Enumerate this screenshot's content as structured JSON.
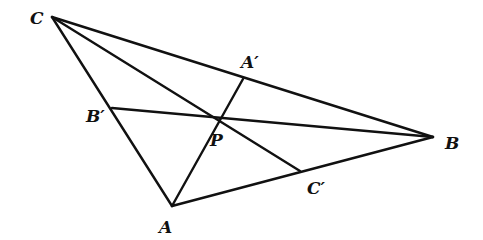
{
  "diagram": {
    "type": "geometry",
    "stroke_color": "#111111",
    "background": "#ffffff",
    "points": {
      "A": {
        "x": 172,
        "y": 206
      },
      "B": {
        "x": 433,
        "y": 137
      },
      "C": {
        "x": 52,
        "y": 17
      },
      "A_prime": {
        "x": 243,
        "y": 79
      },
      "B_prime": {
        "x": 112,
        "y": 108
      },
      "C_prime": {
        "x": 300,
        "y": 171
      },
      "P": {
        "x": 217,
        "y": 118
      }
    },
    "labels": {
      "A": "A",
      "B": "B",
      "C": "C",
      "A_prime": "A′",
      "B_prime": "B′",
      "C_prime": "C′",
      "P": "P"
    },
    "segments": [
      {
        "name": "side-CB",
        "from": "C",
        "to": "B"
      },
      {
        "name": "side-CA",
        "from": "C",
        "to": "A"
      },
      {
        "name": "side-AB",
        "from": "A",
        "to": "B"
      },
      {
        "name": "cevian-AA-prime",
        "from": "A",
        "to": "A_prime"
      },
      {
        "name": "cevian-BB-prime",
        "from": "B",
        "to": "B_prime"
      },
      {
        "name": "cevian-CC-prime",
        "from": "C",
        "to": "C_prime"
      }
    ]
  }
}
